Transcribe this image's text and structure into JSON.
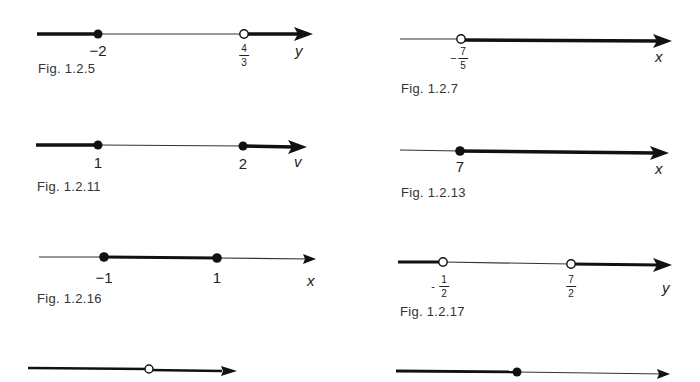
{
  "figures": [
    {
      "id": "f125",
      "caption": "Fig. 1.2.5",
      "variable": "y",
      "points": [
        {
          "label": "−2",
          "value": -2,
          "closed": true
        },
        {
          "num": "4",
          "den": "3",
          "sign": "",
          "value": 1.3333,
          "closed": false
        }
      ],
      "shading": "left of -2 and right of 4/3"
    },
    {
      "id": "f127",
      "caption": "Fig. 1.2.7",
      "variable": "x",
      "points": [
        {
          "num": "7",
          "den": "5",
          "sign": "−",
          "value": -1.4,
          "closed": false
        }
      ],
      "shading": "right of -7/5"
    },
    {
      "id": "f1211",
      "caption": "Fig. 1.2.11",
      "variable": "v",
      "points": [
        {
          "label": "1",
          "value": 1,
          "closed": true
        },
        {
          "label": "2",
          "value": 2,
          "closed": true
        }
      ],
      "shading": "left of 1 and right of 2"
    },
    {
      "id": "f1213",
      "caption": "Fig. 1.2.13",
      "variable": "x",
      "points": [
        {
          "label": "7",
          "value": 7,
          "closed": true
        }
      ],
      "shading": "right of 7"
    },
    {
      "id": "f1216",
      "caption": "Fig. 1.2.16",
      "variable": "x",
      "points": [
        {
          "label": "−1",
          "value": -1,
          "closed": true
        },
        {
          "label": "1",
          "value": 1,
          "closed": true
        }
      ],
      "shading": "between -1 and 1"
    },
    {
      "id": "f1217",
      "caption": "Fig. 1.2.17",
      "variable": "y",
      "points": [
        {
          "num": "1",
          "den": "2",
          "sign": "-",
          "value": -0.5,
          "closed": false
        },
        {
          "num": "7",
          "den": "2",
          "sign": "",
          "value": 3.5,
          "closed": false
        }
      ],
      "shading": "left of -1/2 and right of 7/2"
    },
    {
      "id": "f_bottom_left",
      "caption": "",
      "variable": "",
      "points": [
        {
          "closed": false
        }
      ],
      "shading": "all except point"
    },
    {
      "id": "f_bottom_right",
      "caption": "",
      "variable": "",
      "points": [
        {
          "closed": true
        }
      ],
      "shading": "left of point"
    }
  ]
}
